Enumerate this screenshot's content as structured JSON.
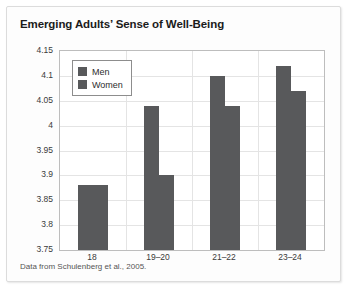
{
  "card": {
    "background_color": "#fdfdfd",
    "border_color": "#dcdcdc"
  },
  "source_note": "Data from Schulenberg et al., 2005.",
  "legend": {
    "entries": [
      {
        "label": "Men",
        "color": "#58595b"
      },
      {
        "label": "Women",
        "color": "#58595b"
      }
    ]
  },
  "chart_data": {
    "type": "bar",
    "title": "Emerging Adults’ Sense of Well-Being",
    "xlabel": "",
    "ylabel": "",
    "categories": [
      "18",
      "19–20",
      "21–22",
      "23–24"
    ],
    "series": [
      {
        "name": "Men",
        "color": "#58595b",
        "values": [
          3.88,
          4.04,
          4.1,
          4.12
        ]
      },
      {
        "name": "Women",
        "color": "#58595b",
        "values": [
          3.88,
          3.9,
          4.04,
          4.07
        ]
      }
    ],
    "ylim": [
      3.75,
      4.15
    ],
    "ytick_step": 0.05,
    "ytick_labels": [
      "4.15",
      "4.1",
      "4.05",
      "4",
      "3.95",
      "3.9",
      "3.85",
      "3.8",
      "3.75"
    ],
    "ytick_values": [
      4.15,
      4.1,
      4.05,
      4.0,
      3.95,
      3.9,
      3.85,
      3.8,
      3.75
    ],
    "grid": true,
    "legend_position": "top-left"
  }
}
